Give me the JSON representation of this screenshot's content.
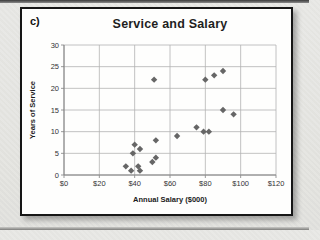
{
  "figure_label": "c)",
  "chart_data": {
    "type": "scatter",
    "title": "Service and Salary",
    "xlabel": "Annual Salary ($000)",
    "ylabel": "Years of Service",
    "xlim": [
      0,
      120
    ],
    "ylim": [
      0,
      30
    ],
    "xticks": [
      0,
      20,
      40,
      60,
      80,
      100,
      120
    ],
    "xtick_labels": [
      "$0",
      "$20",
      "$40",
      "$60",
      "$80",
      "$100",
      "$120"
    ],
    "yticks": [
      0,
      5,
      10,
      15,
      20,
      25,
      30
    ],
    "ytick_labels": [
      "0",
      "5",
      "10",
      "15",
      "20",
      "25",
      "30"
    ],
    "grid": true,
    "legend": "none",
    "marker": "diamond",
    "colors": {
      "marker": "#666666",
      "grid": "#b3b3b3",
      "axis": "#808080",
      "tick_text": "#333333",
      "title_text": "#1f1f1f"
    },
    "points": [
      [
        35,
        2
      ],
      [
        38,
        1
      ],
      [
        39,
        5
      ],
      [
        40,
        7
      ],
      [
        42,
        2
      ],
      [
        43,
        1
      ],
      [
        43,
        6
      ],
      [
        50,
        3
      ],
      [
        52,
        4
      ],
      [
        52,
        8
      ],
      [
        51,
        22
      ],
      [
        64,
        9
      ],
      [
        75,
        11
      ],
      [
        79,
        10
      ],
      [
        82,
        10
      ],
      [
        80,
        22
      ],
      [
        85,
        23
      ],
      [
        90,
        24
      ],
      [
        90,
        15
      ],
      [
        96,
        14
      ]
    ]
  }
}
